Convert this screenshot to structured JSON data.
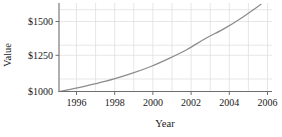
{
  "chart_data": {
    "type": "line",
    "title": "",
    "xlabel": "Year",
    "ylabel": "Value",
    "xlim": [
      1995,
      2006.6
    ],
    "ylim": [
      1000,
      1640
    ],
    "grid": true,
    "legend": false,
    "x_ticks": [
      1996,
      1998,
      2000,
      2002,
      2004,
      2006
    ],
    "x_tick_labels": [
      "1996",
      "1998",
      "2000",
      "2002",
      "2004",
      "2006"
    ],
    "x_gridlines": [
      1996,
      1997,
      1998,
      1999,
      2000,
      2001,
      2002,
      2003,
      2004,
      2005,
      2006
    ],
    "y_ticks": [
      1000,
      1250,
      1500
    ],
    "y_tick_labels": [
      "$1000",
      "$1250",
      "$1500"
    ],
    "y_gridlines": [
      1125,
      1250,
      1375,
      1500,
      1625
    ],
    "series": [
      {
        "name": "Value",
        "color": "#8c8c8c",
        "x": [
          1995,
          1996,
          1997,
          1998,
          1999,
          2000,
          2001,
          2002,
          2003,
          2004,
          2005,
          2006
        ],
        "values": [
          1000,
          1025,
          1055,
          1088,
          1128,
          1175,
          1232,
          1296,
          1372,
          1440,
          1520,
          1610
        ]
      }
    ]
  },
  "axes": {
    "y_label": "Value",
    "x_label": "Year",
    "y_tick_0": "$1000",
    "y_tick_1": "$1250",
    "y_tick_2": "$1500",
    "x_tick_0": "1996",
    "x_tick_1": "1998",
    "x_tick_2": "2000",
    "x_tick_3": "2002",
    "x_tick_4": "2004",
    "x_tick_5": "2006"
  },
  "colors": {
    "curve": "#8c8c8c",
    "grid": "#d8d8d8",
    "axis": "#7a7a7a",
    "text": "#1a1a1a"
  }
}
